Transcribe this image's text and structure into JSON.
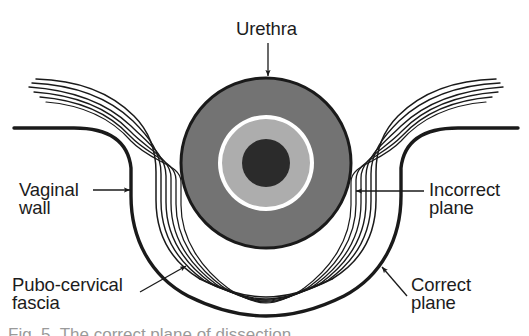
{
  "figure": {
    "type": "medical-anatomical-diagram",
    "background_color": "#ffffff",
    "line_color": "#1a1a1a"
  },
  "labels": {
    "urethra": "Urethra",
    "vaginal_wall": "Vaginal\nwall",
    "pubo_cervical_fascia": "Pubo-cervical\nfascia",
    "incorrect_plane": "Incorrect\nplane",
    "correct_plane": "Correct\nplane"
  },
  "caption": {
    "text": "Fig. 5  The correct plane of dissection"
  },
  "urethra_structure": {
    "name": "urethra-cross-section",
    "center_x": 266,
    "center_y": 163,
    "rings": [
      {
        "name": "outer-muscle-layer",
        "radius": 86,
        "fill": "#737373",
        "stroke": "#1a1a1a",
        "stroke_width": 3
      },
      {
        "name": "white-separation-ring",
        "radius": 48,
        "fill": "#ffffff",
        "stroke": "none",
        "stroke_width": 0
      },
      {
        "name": "submucosa-layer",
        "radius": 44,
        "fill": "#adadad",
        "stroke": "none",
        "stroke_width": 0
      },
      {
        "name": "urethral-lumen",
        "radius": 24,
        "fill": "#2b2b2b",
        "stroke": "none",
        "stroke_width": 0
      }
    ]
  },
  "tissue_layers": {
    "vaginal_wall": {
      "name": "vaginal-wall-line",
      "stroke": "#1a1a1a",
      "stroke_width": 3.4,
      "count": 1
    },
    "pubo_cervical_fascia": {
      "name": "pubo-cervical-fascia-bundle",
      "stroke": "#1a1a1a",
      "stroke_width": 1.5,
      "count": 6
    }
  },
  "annotations": [
    {
      "name": "urethra-arrow",
      "label": "Urethra",
      "direction": "down",
      "from_x": 268,
      "from_y": 43,
      "to_x": 268,
      "to_y": 77
    },
    {
      "name": "vaginal-wall-arrow",
      "label": "Vaginal wall",
      "direction": "right",
      "from_x": 93,
      "from_y": 190,
      "to_x": 131,
      "to_y": 190
    },
    {
      "name": "pubo-cervical-fascia-arrow",
      "label": "Pubo-cervical fascia",
      "direction": "up-right",
      "from_x": 140,
      "from_y": 291,
      "to_x": 186,
      "to_y": 266
    },
    {
      "name": "incorrect-plane-arrow",
      "label": "Incorrect plane",
      "direction": "left",
      "from_x": 424,
      "from_y": 191,
      "to_x": 355,
      "to_y": 191
    },
    {
      "name": "correct-plane-arrow",
      "label": "Correct plane",
      "direction": "up-left",
      "from_x": 406,
      "from_y": 295,
      "to_x": 381,
      "to_y": 266
    }
  ]
}
